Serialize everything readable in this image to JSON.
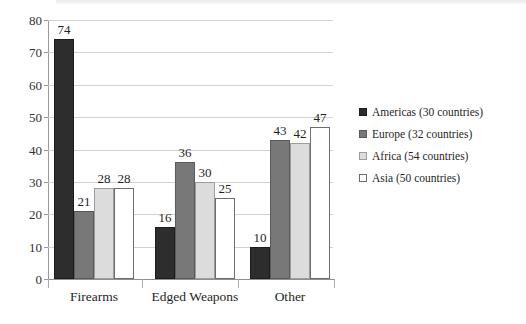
{
  "chart_data": {
    "type": "bar",
    "title": "",
    "subtitle": "",
    "xlabel": "",
    "ylabel": "",
    "ylim": [
      0,
      80
    ],
    "ytick_step": 10,
    "yticks": [
      "0",
      "10",
      "20",
      "30",
      "40",
      "50",
      "60",
      "70",
      "80"
    ],
    "grid": true,
    "grid_axis": "y",
    "legend_position": "right",
    "categories": [
      "Firearms",
      "Edged Weapons",
      "Other"
    ],
    "series": [
      {
        "name": "Americas (30 countries)",
        "short_name": "Americas",
        "countries": 30,
        "color": "#2d2d2d",
        "values": [
          74,
          16,
          10
        ]
      },
      {
        "name": "Europe (32 countries)",
        "short_name": "Europe",
        "countries": 32,
        "color": "#787878",
        "values": [
          21,
          36,
          43
        ]
      },
      {
        "name": "Africa (54 countries)",
        "short_name": "Africa",
        "countries": 54,
        "color": "#dcdcdc",
        "values": [
          28,
          30,
          42
        ]
      },
      {
        "name": "Asia (50 countries)",
        "short_name": "Asia",
        "countries": 50,
        "color": "#ffffff",
        "values": [
          28,
          25,
          47
        ]
      }
    ],
    "data_labels": [
      [
        "74",
        "21",
        "28",
        "28"
      ],
      [
        "16",
        "36",
        "30",
        "25"
      ],
      [
        "10",
        "43",
        "42",
        "47"
      ]
    ]
  }
}
